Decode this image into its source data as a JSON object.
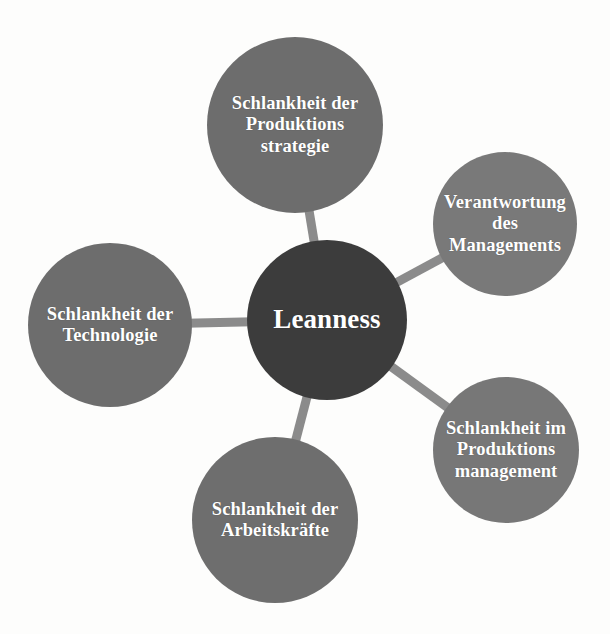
{
  "diagram": {
    "title": "Leanness",
    "type": "hub-and-spoke",
    "background_color": "#fdfdfc",
    "text_color": "#ffffff",
    "edge_color": "#8b8b8b",
    "center": {
      "id": "leanness",
      "label": "Leanness",
      "color": "#3c3c3c",
      "cx": 327,
      "cy": 320,
      "r": 80
    },
    "nodes": [
      {
        "id": "produktionsstrategie",
        "label": "Schlankheit der Produktions strategie",
        "lines": [
          "Schlankheit",
          "der",
          "Produktions",
          "strategie"
        ],
        "color": "#6d6d6d",
        "cx": 295,
        "cy": 125,
        "r": 88
      },
      {
        "id": "verantwortung-management",
        "label": "Verantwortung des Managements",
        "lines": [
          "Verantwortung",
          "des",
          "Managements"
        ],
        "color": "#797979",
        "cx": 505,
        "cy": 224,
        "r": 72
      },
      {
        "id": "produktionsmanagement",
        "label": "Schlankheit im Produktions management",
        "lines": [
          "Schlankheit",
          "im",
          "Produktions",
          "management"
        ],
        "color": "#777777",
        "cx": 506,
        "cy": 450,
        "r": 73
      },
      {
        "id": "arbeitskraefte",
        "label": "Schlankheit der Arbeitskräfte",
        "lines": [
          "Schlankheit",
          "der",
          "Arbeitskräfte"
        ],
        "color": "#6e6e6e",
        "cx": 275,
        "cy": 520,
        "r": 83
      },
      {
        "id": "technologie",
        "label": "Schlankheit der Technologie",
        "lines": [
          "Schlankheit",
          "der",
          "Technologie"
        ],
        "color": "#6d6d6d",
        "cx": 110,
        "cy": 325,
        "r": 82
      }
    ],
    "edges": [
      {
        "from": "leanness",
        "to": "produktionsstrategie"
      },
      {
        "from": "leanness",
        "to": "verantwortung-management"
      },
      {
        "from": "leanness",
        "to": "produktionsmanagement"
      },
      {
        "from": "leanness",
        "to": "arbeitskraefte"
      },
      {
        "from": "leanness",
        "to": "technologie"
      }
    ]
  }
}
